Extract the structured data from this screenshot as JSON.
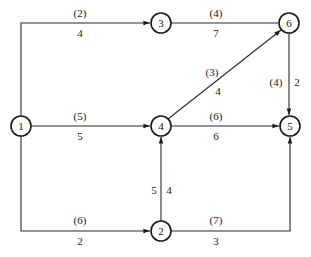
{
  "diagram": {
    "type": "network-graph",
    "nodes": [
      {
        "id": "1",
        "label": "1",
        "x": 21,
        "y": 126
      },
      {
        "id": "2",
        "label": "2",
        "x": 161,
        "y": 231
      },
      {
        "id": "3",
        "label": "3",
        "x": 161,
        "y": 23
      },
      {
        "id": "4",
        "label": "4",
        "x": 161,
        "y": 126
      },
      {
        "id": "5",
        "label": "5",
        "x": 290,
        "y": 126
      },
      {
        "id": "6",
        "label": "6",
        "x": 289,
        "y": 23
      }
    ],
    "edges": [
      {
        "id": "e1-3",
        "from": "1",
        "to": "3",
        "capacity": "(2)",
        "weight": "4"
      },
      {
        "id": "e1-4",
        "from": "1",
        "to": "4",
        "capacity": "(5)",
        "weight": "5"
      },
      {
        "id": "e1-2",
        "from": "1",
        "to": "2",
        "capacity": "(6)",
        "weight": "2"
      },
      {
        "id": "e3-6",
        "from": "3",
        "to": "6",
        "capacity": "(4)",
        "weight": "7"
      },
      {
        "id": "e4-6",
        "from": "4",
        "to": "6",
        "capacity": "(3)",
        "weight": "4"
      },
      {
        "id": "e4-5",
        "from": "4",
        "to": "5",
        "capacity": "(6)",
        "weight": "6"
      },
      {
        "id": "e6-5",
        "from": "6",
        "to": "5",
        "capacity": "(4)",
        "weight": "2"
      },
      {
        "id": "e2-4",
        "from": "2",
        "to": "4",
        "capacity": "5",
        "weight": "4"
      },
      {
        "id": "e2-5",
        "from": "2",
        "to": "5",
        "capacity": "(7)",
        "weight": "3"
      }
    ]
  }
}
